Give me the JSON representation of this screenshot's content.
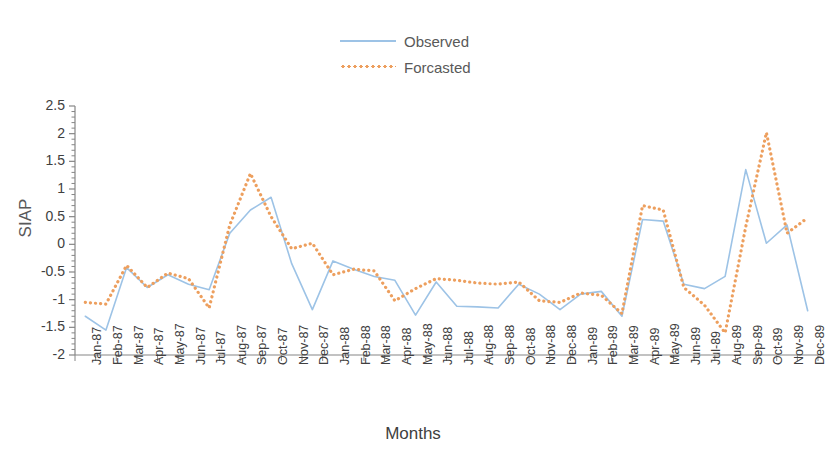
{
  "chart_data": {
    "type": "line",
    "title": "",
    "xlabel": "Months",
    "ylabel": "SIAP",
    "ylim": [
      -2,
      2.5
    ],
    "ytick_step": 0.5,
    "minor_ticks_per_major": 5,
    "grid": false,
    "legend_position": "top-center",
    "categories": [
      "Jan-87",
      "Feb-87",
      "Mar-87",
      "Apr-87",
      "May-87",
      "Jun-87",
      "Jul-87",
      "Aug-87",
      "Sep-87",
      "Oct-87",
      "Nov-87",
      "Dec-87",
      "Jan-88",
      "Feb-88",
      "Mar-88",
      "Apr-88",
      "May-88",
      "Jun-88",
      "Jul-88",
      "Aug-88",
      "Sep-88",
      "Oct-88",
      "Nov-88",
      "Dec-88",
      "Jan-89",
      "Feb-89",
      "Mar-89",
      "Apr-89",
      "May-89",
      "Jun-89",
      "Jul-89",
      "Aug-89",
      "Sep-89",
      "Oct-89",
      "Nov-89",
      "Dec-89"
    ],
    "yticks": [
      "2.5",
      "2",
      "1.5",
      "1",
      "0.5",
      "0",
      "-0.5",
      "-1",
      "-1.5",
      "-2"
    ],
    "series": [
      {
        "name": "Observed",
        "color": "#9DC3E6",
        "style": "solid",
        "values": [
          -1.3,
          -1.55,
          -0.42,
          -0.78,
          -0.55,
          -0.72,
          -0.82,
          0.2,
          0.62,
          0.85,
          -0.35,
          -1.18,
          -0.3,
          -0.45,
          -0.58,
          -0.65,
          -1.28,
          -0.68,
          -1.12,
          -1.13,
          -1.15,
          -0.72,
          -0.9,
          -1.18,
          -0.9,
          -0.85,
          -1.3,
          0.45,
          0.42,
          -0.72,
          -0.8,
          -0.58,
          1.35,
          0.02,
          0.35,
          -1.2
        ]
      },
      {
        "name": "Forcasted",
        "color": "#ED9F5E",
        "style": "dotted",
        "values": [
          -1.05,
          -1.08,
          -0.38,
          -0.78,
          -0.52,
          -0.62,
          -1.15,
          0.35,
          1.28,
          0.5,
          -0.08,
          0.02,
          -0.55,
          -0.45,
          -0.48,
          -1.02,
          -0.8,
          -0.62,
          -0.65,
          -0.7,
          -0.72,
          -0.68,
          -1.02,
          -1.05,
          -0.88,
          -0.92,
          -1.25,
          0.7,
          0.62,
          -0.78,
          -1.1,
          -1.6,
          0.32,
          2.02,
          0.2,
          0.48
        ]
      }
    ]
  },
  "legend": {
    "items": [
      {
        "label": "Observed"
      },
      {
        "label": "Forcasted"
      }
    ]
  },
  "axes": {
    "y_title": "SIAP",
    "x_title": "Months"
  },
  "colors": {
    "observed": "#9DC3E6",
    "forecasted": "#ED9F5E",
    "axis": "#868686",
    "text": "#404040"
  }
}
